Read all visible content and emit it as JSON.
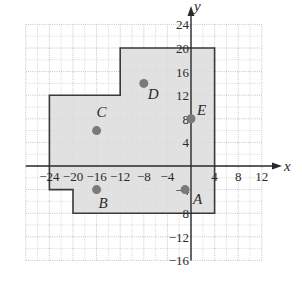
{
  "figure": {
    "axes": {
      "x_label": "x",
      "y_label": "y",
      "x_range": [
        -28,
        12
      ],
      "y_range": [
        -16,
        24
      ],
      "grid_step": 4,
      "x_ticks": [
        {
          "value": -24,
          "label": "−24"
        },
        {
          "value": -20,
          "label": "−20"
        },
        {
          "value": -16,
          "label": "−16"
        },
        {
          "value": -12,
          "label": "−12"
        },
        {
          "value": -8,
          "label": "−8"
        },
        {
          "value": -4,
          "label": "−4"
        },
        {
          "value": 4,
          "label": "4"
        },
        {
          "value": 8,
          "label": "8"
        },
        {
          "value": 12,
          "label": "12"
        }
      ],
      "y_ticks": [
        {
          "value": 24,
          "label": "24"
        },
        {
          "value": 20,
          "label": "20"
        },
        {
          "value": 16,
          "label": "16"
        },
        {
          "value": 12,
          "label": "12"
        },
        {
          "value": 8,
          "label": "8"
        },
        {
          "value": 4,
          "label": "4"
        },
        {
          "value": -4,
          "label": "−4"
        },
        {
          "value": -8,
          "label": "−8"
        },
        {
          "value": -12,
          "label": "−12"
        },
        {
          "value": -16,
          "label": "−16"
        }
      ]
    },
    "region": {
      "fill": "#dcdcdc",
      "stroke": "#3a3a3a",
      "vertices": [
        [
          -24,
          12
        ],
        [
          -12,
          12
        ],
        [
          -12,
          20
        ],
        [
          4,
          20
        ],
        [
          4,
          -8
        ],
        [
          -20,
          -8
        ],
        [
          -20,
          -4
        ],
        [
          -24,
          -4
        ]
      ]
    },
    "points": [
      {
        "name": "A",
        "x": -1,
        "y": -4
      },
      {
        "name": "B",
        "x": -16,
        "y": -4
      },
      {
        "name": "C",
        "x": -16,
        "y": 6
      },
      {
        "name": "D",
        "x": -8,
        "y": 14
      },
      {
        "name": "E",
        "x": 0,
        "y": 8
      }
    ],
    "colors": {
      "grid": "#b5b5b5",
      "axis": "#2a2a2a",
      "point": "#7a7a7a"
    }
  }
}
